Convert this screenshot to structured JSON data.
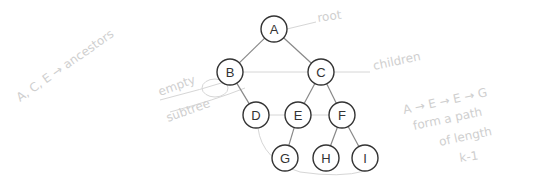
{
  "diagram": {
    "type": "binary-tree",
    "nodes": [
      {
        "id": "A",
        "label": "A",
        "x": 274,
        "y": 29
      },
      {
        "id": "B",
        "label": "B",
        "x": 230,
        "y": 72
      },
      {
        "id": "C",
        "label": "C",
        "x": 321,
        "y": 72
      },
      {
        "id": "D",
        "label": "D",
        "x": 256,
        "y": 115
      },
      {
        "id": "E",
        "label": "E",
        "x": 298,
        "y": 115
      },
      {
        "id": "F",
        "label": "F",
        "x": 342,
        "y": 115
      },
      {
        "id": "G",
        "label": "G",
        "x": 285,
        "y": 158
      },
      {
        "id": "H",
        "label": "H",
        "x": 326,
        "y": 158
      },
      {
        "id": "I",
        "label": "I",
        "x": 365,
        "y": 158
      }
    ],
    "edges": [
      [
        "A",
        "B"
      ],
      [
        "A",
        "C"
      ],
      [
        "B",
        "D"
      ],
      [
        "C",
        "E"
      ],
      [
        "C",
        "F"
      ],
      [
        "E",
        "G"
      ],
      [
        "F",
        "H"
      ],
      [
        "F",
        "I"
      ]
    ],
    "node_radius": 13,
    "node_stroke": "#333333",
    "edge_color": "#888888"
  },
  "annotations": {
    "root": "root",
    "children": "children",
    "empty_subtree": "empty",
    "subtree": "subtree",
    "siblings": "A, C, E → ancestors",
    "path_line1": "A → E → E → G",
    "path_line2": "form a path",
    "path_line3": "of length",
    "path_line4": "k-1"
  },
  "colors": {
    "annotation": "#cfcfcf"
  }
}
